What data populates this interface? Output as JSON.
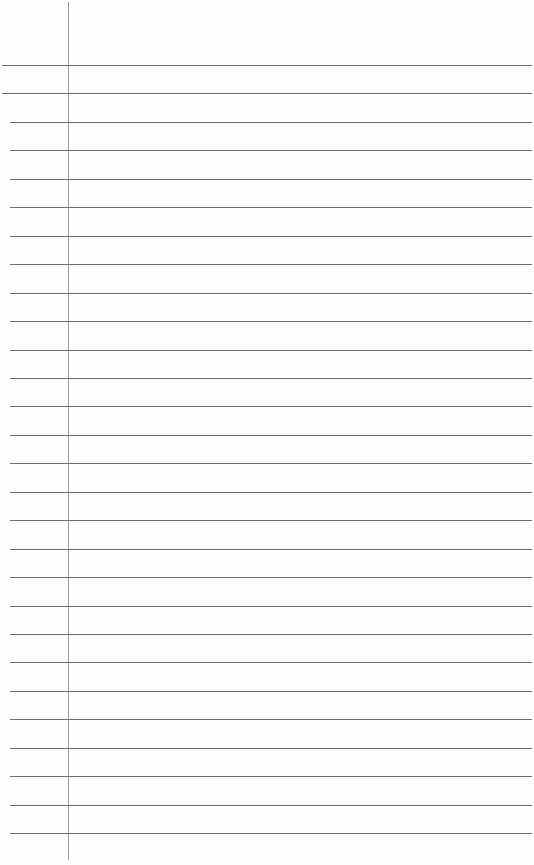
{
  "paper": {
    "type": "lined-notebook-page",
    "line_count": 28,
    "first_line_y": 65,
    "line_spacing": 28.45,
    "margin_x": 68,
    "colors": {
      "background": "#fefefe",
      "rule": "#6e6e6e",
      "margin": "#9a9a9a"
    }
  }
}
